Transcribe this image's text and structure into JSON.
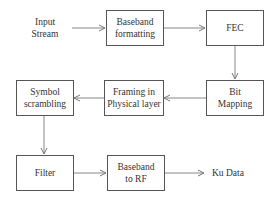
{
  "diagram": {
    "input_label": "Input\nStream",
    "output_label": "Ku Data",
    "blocks": [
      {
        "id": "baseband-formatting",
        "label": "Baseband\nformatting"
      },
      {
        "id": "fec",
        "label": "FEC"
      },
      {
        "id": "bit-mapping",
        "label": "Bit\nMapping"
      },
      {
        "id": "framing-physical-layer",
        "label": "Framing in\nPhysical layer"
      },
      {
        "id": "symbol-scrambling",
        "label": "Symbol\nscrambling"
      },
      {
        "id": "filter",
        "label": "Filter"
      },
      {
        "id": "baseband-to-rf",
        "label": "Baseband\nto RF"
      }
    ],
    "flow": [
      "Input Stream",
      "Baseband formatting",
      "FEC",
      "Bit Mapping",
      "Framing in Physical layer",
      "Symbol scrambling",
      "Filter",
      "Baseband to RF",
      "Ku Data"
    ],
    "colors": {
      "line": "#777777",
      "border": "#555555",
      "text": "#333333"
    }
  }
}
